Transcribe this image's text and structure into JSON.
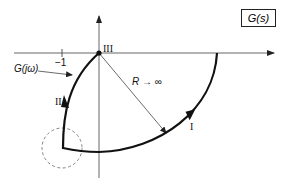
{
  "title_box": "G(s)",
  "labels": {
    "g_jw": "G(jω)",
    "minus_one": "−1",
    "region_I": "I",
    "region_II": "II",
    "region_III": "III",
    "radius": "R → ∞"
  },
  "colors": {
    "curve": "#111111",
    "axis": "#555555",
    "dashed_circle": "#666666"
  }
}
